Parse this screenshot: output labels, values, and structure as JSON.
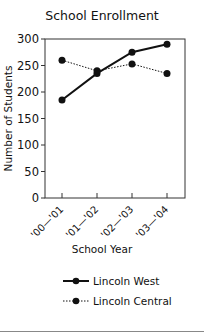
{
  "chart_data": {
    "type": "line",
    "title": "School Enrollment",
    "xlabel": "School Year",
    "ylabel": "Number of Students",
    "categories": [
      "'00—'01",
      "'01—'02",
      "'02—'03",
      "'03—'04"
    ],
    "ylim": [
      0,
      300
    ],
    "yticks": [
      0,
      50,
      100,
      150,
      200,
      250,
      300
    ],
    "grid": false,
    "legend_position": "bottom",
    "series": [
      {
        "name": "Lincoln West",
        "style": "solid",
        "values": [
          185,
          235,
          275,
          290
        ]
      },
      {
        "name": "Lincoln Central",
        "style": "dotted",
        "values": [
          260,
          240,
          253,
          235
        ]
      }
    ]
  }
}
